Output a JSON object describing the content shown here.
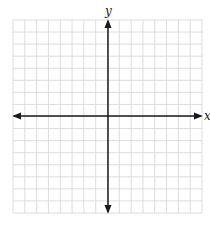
{
  "diagram": {
    "type": "coordinate-plane",
    "x_axis_label": "x",
    "y_axis_label": "y",
    "grid": {
      "columns": 16,
      "rows": 16,
      "left": 13,
      "top": 20,
      "right": 202,
      "bottom": 213,
      "line_color": "#d4d4d4"
    },
    "axes": {
      "origin_x": 108,
      "origin_y": 116,
      "color": "#1a1a1a",
      "arrows": "both-ends"
    }
  }
}
